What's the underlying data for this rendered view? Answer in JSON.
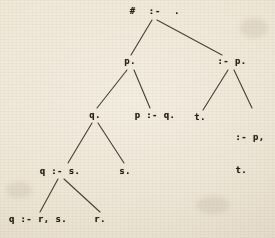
{
  "figure": {
    "kind": "derivation-tree",
    "background_color": "#ece4d4",
    "ink_color": "#2b2319",
    "edge_color": "#3a3026"
  },
  "nodes": {
    "root": {
      "id": "root",
      "label": "#  :-  .",
      "x": 155,
      "y": 8,
      "level": 0
    },
    "p_fact": {
      "id": "p-fact",
      "label": "p.",
      "x": 130,
      "y": 58,
      "level": 1
    },
    "goal_p": {
      "id": "goal-p",
      "label": ":- p.",
      "x": 232,
      "y": 58,
      "level": 1
    },
    "q_fact": {
      "id": "q-fact",
      "label": "q.",
      "x": 95,
      "y": 112,
      "level": 2
    },
    "p_if_q": {
      "id": "p-if-q",
      "label": "p :- q.",
      "x": 155,
      "y": 112,
      "level": 2
    },
    "t_fact": {
      "id": "t-fact",
      "label": "t.",
      "x": 200,
      "y": 114,
      "level": 2
    },
    "goal_p_t_1": {
      "id": "goal-p-t",
      "label": ":- p,",
      "x": 248,
      "y": 112,
      "level": 2
    },
    "goal_p_t_2": {
      "id": "goal-p-t-2",
      "label": "t.",
      "x": 248,
      "y": 123,
      "level": 2
    },
    "q_if_s": {
      "id": "q-if-s",
      "label": "q :- s.",
      "x": 60,
      "y": 168,
      "level": 3
    },
    "s_fact": {
      "id": "s-fact",
      "label": "s.",
      "x": 125,
      "y": 168,
      "level": 3
    },
    "q_if_r_s": {
      "id": "q-if-r-s",
      "label": "q :- r, s.",
      "x": 38,
      "y": 216,
      "level": 4
    },
    "r_fact": {
      "id": "r-fact",
      "label": "r.",
      "x": 100,
      "y": 216,
      "level": 4
    }
  },
  "node_text": {
    "root": "#  :-  .",
    "p_fact": "p.",
    "goal_p": ":- p.",
    "q_fact": "q.",
    "p_if_q": "p :- q.",
    "t_fact": "t.",
    "goal_p_t_line1": ":- p,",
    "goal_p_t_line2": "t.",
    "q_if_s": "q :- s.",
    "s_fact": "s.",
    "q_if_r_s": "q :- r, s.",
    "r_fact": "r."
  },
  "edges": [
    {
      "from": "root",
      "to": "p_fact",
      "x1": 152,
      "y1": 20,
      "x2": 131,
      "y2": 55
    },
    {
      "from": "root",
      "to": "goal_p",
      "x1": 157,
      "y1": 20,
      "x2": 222,
      "y2": 55
    },
    {
      "from": "p_fact",
      "to": "q_fact",
      "x1": 127,
      "y1": 70,
      "x2": 97,
      "y2": 108
    },
    {
      "from": "p_fact",
      "to": "p_if_q",
      "x1": 134,
      "y1": 70,
      "x2": 150,
      "y2": 108
    },
    {
      "from": "goal_p",
      "to": "t_fact",
      "x1": 228,
      "y1": 70,
      "x2": 203,
      "y2": 110
    },
    {
      "from": "goal_p",
      "to": "goal_p_t",
      "x1": 234,
      "y1": 70,
      "x2": 252,
      "y2": 108
    },
    {
      "from": "q_fact",
      "to": "q_if_s",
      "x1": 92,
      "y1": 123,
      "x2": 68,
      "y2": 163
    },
    {
      "from": "q_fact",
      "to": "s_fact",
      "x1": 98,
      "y1": 123,
      "x2": 124,
      "y2": 163
    },
    {
      "from": "q_if_s",
      "to": "q_if_r_s",
      "x1": 58,
      "y1": 179,
      "x2": 40,
      "y2": 212
    },
    {
      "from": "q_if_s",
      "to": "r_fact",
      "x1": 64,
      "y1": 179,
      "x2": 100,
      "y2": 212
    }
  ]
}
